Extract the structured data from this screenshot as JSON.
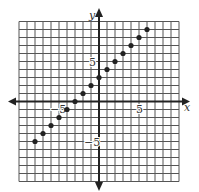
{
  "chart_data": {
    "type": "scatter",
    "title": "",
    "xlabel": "x",
    "ylabel": "y",
    "xlim": [
      -10,
      10
    ],
    "ylim": [
      -10,
      10
    ],
    "grid": true,
    "grid_step": 1,
    "tick_labels": {
      "x": [
        {
          "value": -5,
          "label": "−5"
        },
        {
          "value": 5,
          "label": "5"
        }
      ],
      "y": [
        {
          "value": 5,
          "label": "5"
        },
        {
          "value": -5,
          "label": "−5"
        }
      ]
    },
    "series": [
      {
        "name": "points",
        "relation": "y = x + 3",
        "points": [
          [
            -8,
            -5
          ],
          [
            -7,
            -4
          ],
          [
            -6,
            -3
          ],
          [
            -5,
            -2
          ],
          [
            -4,
            -1
          ],
          [
            -3,
            0
          ],
          [
            -2,
            1
          ],
          [
            -1,
            2
          ],
          [
            0,
            3
          ],
          [
            1,
            4
          ],
          [
            2,
            5
          ],
          [
            3,
            6
          ],
          [
            4,
            7
          ],
          [
            5,
            8
          ],
          [
            6,
            9
          ]
        ]
      }
    ],
    "colors": {
      "grid": "#555555",
      "axis": "#222222",
      "point": "#222222"
    }
  },
  "labels": {
    "x_axis": "x",
    "y_axis": "y"
  }
}
